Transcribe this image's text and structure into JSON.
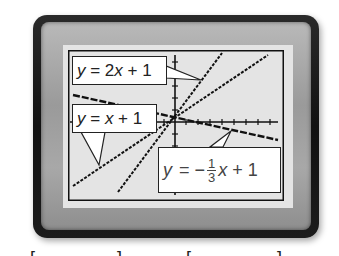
{
  "device": {
    "type": "graphing-calculator-screen",
    "frame_color": "#1a1a1a",
    "bezel_color": "#a0a0a0",
    "screen_color": "#e4e4e4"
  },
  "graph": {
    "origin_px": [
      107,
      72
    ],
    "lines": [
      {
        "id": "line-2x",
        "equation": "y = 2x + 1",
        "slope": 2,
        "intercept": 1
      },
      {
        "id": "line-x",
        "equation": "y = x + 1",
        "slope": 1,
        "intercept": 1
      },
      {
        "id": "line-neg-third",
        "equation": "y = −1/3x + 1",
        "slope": -0.3333,
        "intercept": 1
      }
    ]
  },
  "callouts": {
    "line_2x": {
      "y": "y",
      "eq": " = 2",
      "x": "x",
      "rest": " + 1"
    },
    "line_x": {
      "y": "y",
      "eq": " = ",
      "x": "x",
      "rest": " + 1"
    },
    "line_neg_third": {
      "y": "y",
      "eq": " = −",
      "num": "1",
      "den": "3",
      "x": "x",
      "rest": " + 1"
    }
  },
  "cropped_caption": {
    "visible_glyph_tops": [
      "[",
      "]",
      "[",
      "]"
    ]
  }
}
